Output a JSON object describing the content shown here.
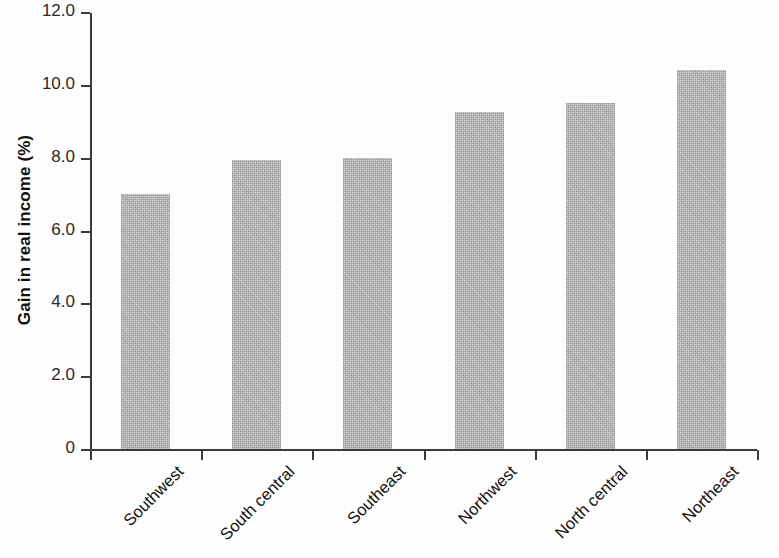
{
  "chart_data": {
    "type": "bar",
    "title": "",
    "subtitle": "",
    "xlabel": "",
    "ylabel": "Gain in real income (%)",
    "categories": [
      "Southwest",
      "South central",
      "Southeast",
      "Northwest",
      "North central",
      "Northeast"
    ],
    "values": [
      7.0,
      7.95,
      8.0,
      9.25,
      9.5,
      10.4
    ],
    "series": [
      {
        "name": "Gain in real income",
        "values": [
          7.0,
          7.95,
          8.0,
          9.25,
          9.5,
          10.4
        ]
      }
    ],
    "ylim": [
      0,
      12.0
    ],
    "ytick_values": [
      12.0,
      10.0,
      8.0,
      6.0,
      4.0,
      2.0,
      0
    ],
    "ytick_labels": [
      "12.0",
      "10.0",
      "8.0",
      "6.0",
      "4.0",
      "2.0",
      "0"
    ],
    "grid": false,
    "legend": null,
    "legend_position": "none",
    "bar_color": "#b4b4b4",
    "axis_color": "#3b3b3b",
    "xlabel_rotation": -45,
    "annotations": []
  }
}
